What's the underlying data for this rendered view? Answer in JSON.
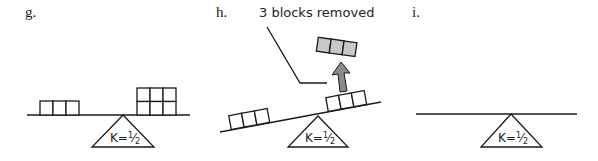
{
  "panels": [
    {
      "id": "g",
      "label": "g.",
      "fulcrum_label": "K=",
      "fulcrum_fraction": "1/2",
      "left_blocks": 3,
      "right_blocks": 6,
      "beam": "level"
    },
    {
      "id": "h",
      "label": "h.",
      "annotation": "3 blocks removed",
      "fulcrum_label": "K=",
      "fulcrum_fraction": "1/2",
      "left_blocks": 3,
      "right_blocks": 3,
      "removed_blocks": 3,
      "beam": "tilted"
    },
    {
      "id": "i",
      "label": "i.",
      "fulcrum_label": "K=",
      "fulcrum_fraction": "1/2",
      "left_blocks": 0,
      "right_blocks": 0,
      "beam": "level"
    }
  ],
  "colors": {
    "line": "#1a1a1a",
    "removed_block_fill": "#c8c8c8",
    "arrow_fill": "#8a8a8a"
  }
}
